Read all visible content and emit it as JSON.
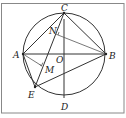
{
  "diagram": {
    "type": "geometry",
    "points": {
      "A": {
        "label": "A",
        "x": 23,
        "y": 54
      },
      "B": {
        "label": "B",
        "x": 106,
        "y": 54
      },
      "C": {
        "label": "C",
        "x": 64,
        "y": 19
      },
      "D": {
        "label": "D",
        "x": 64,
        "y": 98
      },
      "E": {
        "label": "E",
        "x": 35,
        "y": 87
      },
      "O": {
        "label": "O",
        "x": 64,
        "y": 54
      },
      "M": {
        "label": "M",
        "x": 41,
        "y": 68
      },
      "N": {
        "label": "N",
        "x": 57,
        "y": 35
      }
    },
    "circle": {
      "center": "O",
      "radius": 41
    },
    "segments": [
      "AB",
      "CD",
      "CE",
      "AC",
      "BC",
      "AE",
      "BE",
      "AM",
      "BN"
    ],
    "right_angle_marks": [
      "M",
      "N"
    ],
    "colors": {
      "stroke": "#333333",
      "frame": "#888888",
      "background": "#ffffff"
    }
  }
}
